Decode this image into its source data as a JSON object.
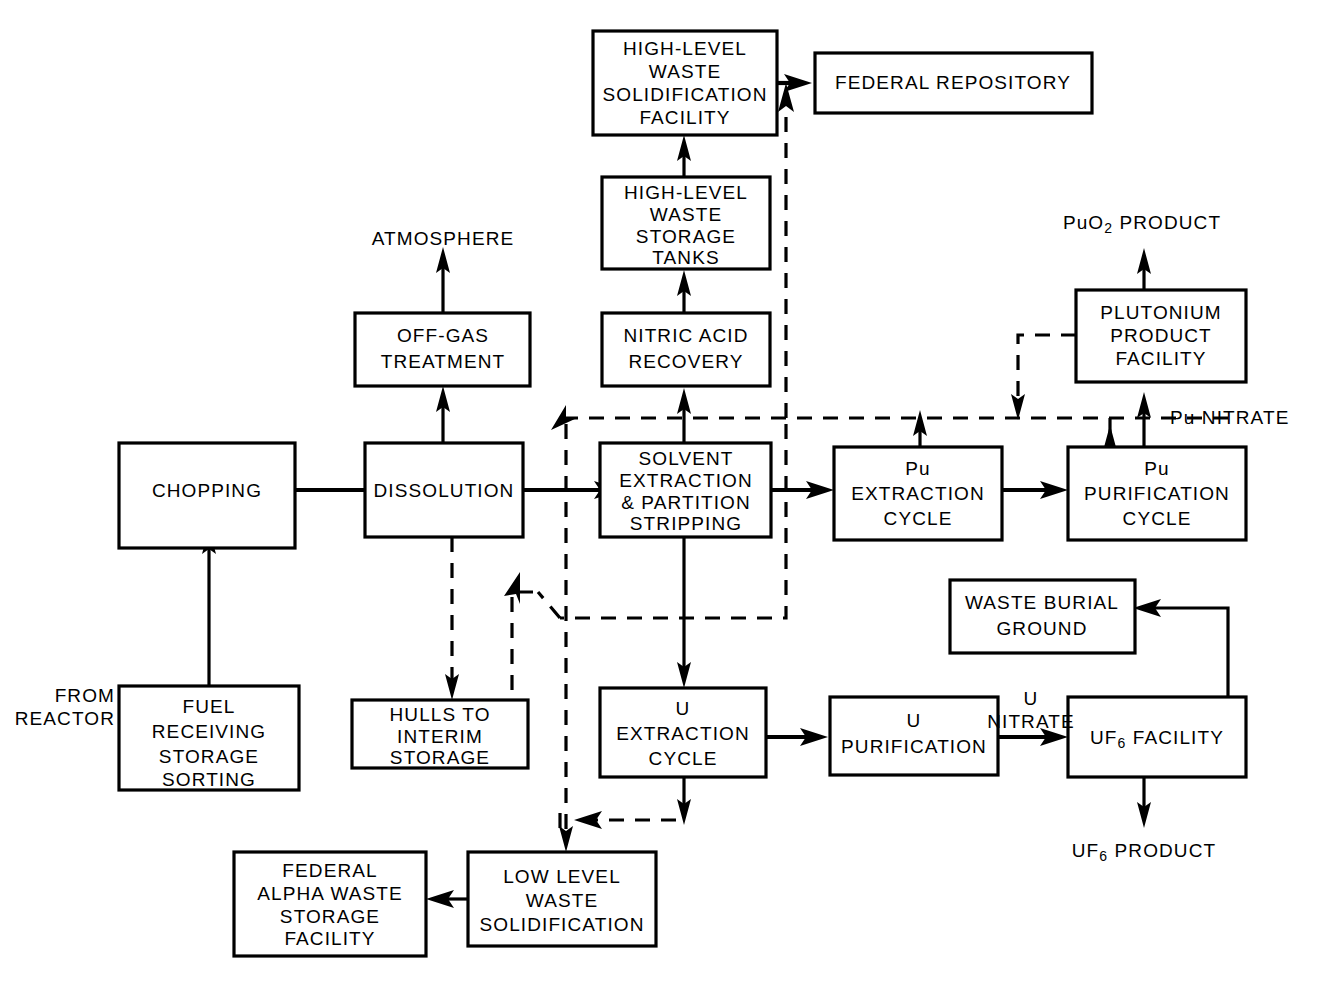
{
  "diagram": {
    "type": "process-flow-diagram",
    "colors": {
      "stroke": "#000000",
      "background": "#ffffff",
      "text": "#000000"
    },
    "legend": {
      "solid_line": "process stream",
      "dashed_line": "recycle / waste stream"
    },
    "nodes": [
      {
        "id": "fuel_receiving",
        "label_lines": [
          "FUEL",
          "RECEIVING",
          "STORAGE",
          "SORTING"
        ]
      },
      {
        "id": "chopping",
        "label_lines": [
          "CHOPPING"
        ]
      },
      {
        "id": "dissolution",
        "label_lines": [
          "DISSOLUTION"
        ]
      },
      {
        "id": "off_gas",
        "label_lines": [
          "OFF-GAS",
          "TREATMENT"
        ]
      },
      {
        "id": "hulls",
        "label_lines": [
          "HULLS TO",
          "INTERIM",
          "STORAGE"
        ]
      },
      {
        "id": "solvent_extraction",
        "label_lines": [
          "SOLVENT",
          "EXTRACTION",
          "& PARTITION",
          "STRIPPING"
        ]
      },
      {
        "id": "nitric_acid",
        "label_lines": [
          "NITRIC ACID",
          "RECOVERY"
        ]
      },
      {
        "id": "hlw_tanks",
        "label_lines": [
          "HIGH-LEVEL",
          "WASTE",
          "STORAGE",
          "TANKS"
        ]
      },
      {
        "id": "hlw_solidification",
        "label_lines": [
          "HIGH-LEVEL",
          "WASTE",
          "SOLIDIFICATION",
          "FACILITY"
        ]
      },
      {
        "id": "federal_repository",
        "label_lines": [
          "FEDERAL REPOSITORY"
        ]
      },
      {
        "id": "pu_extraction",
        "label_lines": [
          "Pu",
          "EXTRACTION",
          "CYCLE"
        ]
      },
      {
        "id": "pu_purification",
        "label_lines": [
          "Pu",
          "PURIFICATION",
          "CYCLE"
        ]
      },
      {
        "id": "plutonium_product",
        "label_lines": [
          "PLUTONIUM",
          "PRODUCT",
          "FACILITY"
        ]
      },
      {
        "id": "u_extraction",
        "label_lines": [
          "U",
          "EXTRACTION",
          "CYCLE"
        ]
      },
      {
        "id": "u_purification",
        "label_lines": [
          "U",
          "PURIFICATION"
        ]
      },
      {
        "id": "uf6_facility",
        "label_lines": [
          "UF6 FACILITY"
        ]
      },
      {
        "id": "waste_burial",
        "label_lines": [
          "WASTE BURIAL",
          "GROUND"
        ]
      },
      {
        "id": "llw_solidification",
        "label_lines": [
          "LOW LEVEL",
          "WASTE",
          "SOLIDIFICATION"
        ]
      },
      {
        "id": "federal_alpha",
        "label_lines": [
          "FEDERAL",
          "ALPHA WASTE",
          "STORAGE",
          "FACILITY"
        ]
      }
    ],
    "labels": [
      {
        "id": "from_reactor",
        "lines": [
          "FROM",
          "REACTOR"
        ]
      },
      {
        "id": "atmosphere",
        "lines": [
          "ATMOSPHERE"
        ]
      },
      {
        "id": "puo2_product",
        "lines": [
          "PuO2 PRODUCT"
        ]
      },
      {
        "id": "pu_nitrate",
        "lines": [
          "Pu NITRATE"
        ]
      },
      {
        "id": "u_nitrate",
        "lines": [
          "U",
          "NITRATE"
        ]
      },
      {
        "id": "uf6_product",
        "lines": [
          "UF6 PRODUCT"
        ]
      }
    ],
    "text": {
      "fuel_receiving_1": "FUEL",
      "fuel_receiving_2": "RECEIVING",
      "fuel_receiving_3": "STORAGE",
      "fuel_receiving_4": "SORTING",
      "chopping_1": "CHOPPING",
      "dissolution_1": "DISSOLUTION",
      "off_gas_1": "OFF-GAS",
      "off_gas_2": "TREATMENT",
      "hulls_1": "HULLS TO",
      "hulls_2": "INTERIM",
      "hulls_3": "STORAGE",
      "solvex_1": "SOLVENT",
      "solvex_2": "EXTRACTION",
      "solvex_3": "& PARTITION",
      "solvex_4": "STRIPPING",
      "nitric_1": "NITRIC ACID",
      "nitric_2": "RECOVERY",
      "hlwtanks_1": "HIGH-LEVEL",
      "hlwtanks_2": "WASTE",
      "hlwtanks_3": "STORAGE",
      "hlwtanks_4": "TANKS",
      "hlwsol_1": "HIGH-LEVEL",
      "hlwsol_2": "WASTE",
      "hlwsol_3": "SOLIDIFICATION",
      "hlwsol_4": "FACILITY",
      "fedrepo_1": "FEDERAL REPOSITORY",
      "puext_1": "Pu",
      "puext_2": "EXTRACTION",
      "puext_3": "CYCLE",
      "pupur_1": "Pu",
      "pupur_2": "PURIFICATION",
      "pupur_3": "CYCLE",
      "ppf_1": "PLUTONIUM",
      "ppf_2": "PRODUCT",
      "ppf_3": "FACILITY",
      "uext_1": "U",
      "uext_2": "EXTRACTION",
      "uext_3": "CYCLE",
      "upur_1": "U",
      "upur_2": "PURIFICATION",
      "uf6fac_main": "UF",
      "uf6fac_sub": "6",
      "uf6fac_tail": " FACILITY",
      "wasteburial_1": "WASTE BURIAL",
      "wasteburial_2": "GROUND",
      "llw_1": "LOW LEVEL",
      "llw_2": "WASTE",
      "llw_3": "SOLIDIFICATION",
      "fedalpha_1": "FEDERAL",
      "fedalpha_2": "ALPHA WASTE",
      "fedalpha_3": "STORAGE",
      "fedalpha_4": "FACILITY",
      "from_reactor_1": "FROM",
      "from_reactor_2": "REACTOR",
      "atmosphere_1": "ATMOSPHERE",
      "puo2_main": "PuO",
      "puo2_sub": "2",
      "puo2_tail": " PRODUCT",
      "punitrate_main": "Pu",
      "punitrate_tail": " NITRATE",
      "unitrate_1": "U",
      "unitrate_2": "NITRATE",
      "uf6prod_main": "UF",
      "uf6prod_sub": "6",
      "uf6prod_tail": " PRODUCT"
    }
  }
}
